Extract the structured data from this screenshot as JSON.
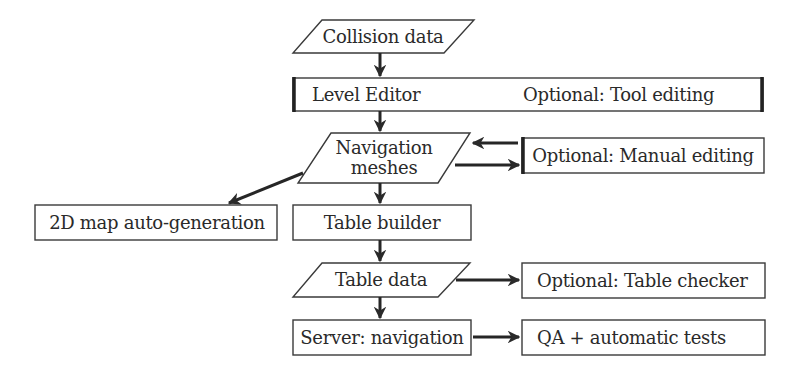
{
  "diagram": {
    "type": "flowchart",
    "colors": {
      "stroke": "#2a2a2a",
      "text": "#2a2a2a",
      "background": "#ffffff"
    },
    "nodes": {
      "collision_data": {
        "shape": "parallelogram",
        "label": "Collision data"
      },
      "level_editor": {
        "shape": "rectangle-split",
        "label": "Level Editor",
        "label_right": "Optional: Tool editing"
      },
      "navigation_meshes": {
        "shape": "parallelogram",
        "label_line1": "Navigation",
        "label_line2": "meshes"
      },
      "manual_editing": {
        "shape": "rectangle",
        "label": "Optional: Manual editing"
      },
      "map_autogen": {
        "shape": "rectangle",
        "label": "2D map auto-generation"
      },
      "table_builder": {
        "shape": "rectangle",
        "label": "Table builder"
      },
      "table_data": {
        "shape": "parallelogram",
        "label": "Table data"
      },
      "table_checker": {
        "shape": "rectangle",
        "label": "Optional: Table checker"
      },
      "server_navigation": {
        "shape": "rectangle",
        "label": "Server: navigation"
      },
      "qa_tests": {
        "shape": "rectangle",
        "label": "QA + automatic tests"
      }
    },
    "edges": [
      {
        "from": "Collision data",
        "to": "Level Editor"
      },
      {
        "from": "Level Editor",
        "to": "Navigation meshes"
      },
      {
        "from": "Optional: Manual editing",
        "to": "Navigation meshes"
      },
      {
        "from": "Navigation meshes",
        "to": "Optional: Manual editing"
      },
      {
        "from": "Navigation meshes",
        "to": "2D map auto-generation"
      },
      {
        "from": "Navigation meshes",
        "to": "Table builder"
      },
      {
        "from": "Table builder",
        "to": "Table data"
      },
      {
        "from": "Table data",
        "to": "Optional: Table checker"
      },
      {
        "from": "Table data",
        "to": "Server: navigation"
      },
      {
        "from": "Server: navigation",
        "to": "QA + automatic tests"
      }
    ]
  }
}
